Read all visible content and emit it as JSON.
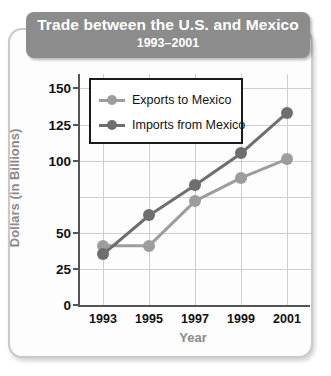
{
  "title": {
    "main": "Trade between the U.S. and Mexico",
    "sub": "1993–2001"
  },
  "colors": {
    "exports": "#9d9d9d",
    "imports": "#6e6e6e",
    "banner": "#8c8c8c",
    "axis": "#555555",
    "grid": "#cfcfcf",
    "axis_title": "#8a8a8a"
  },
  "chart_data": {
    "type": "line",
    "title": "Trade between the U.S. and Mexico",
    "subtitle": "1993–2001",
    "xlabel": "Year",
    "ylabel": "Dollars (in Billions)",
    "categories": [
      "1993",
      "1995",
      "1997",
      "1999",
      "2001"
    ],
    "x": [
      1993,
      1995,
      1997,
      1999,
      2001
    ],
    "xlim": [
      1992,
      2002
    ],
    "ylim": [
      0,
      160
    ],
    "ytick_labels": [
      "0",
      "25",
      "50",
      "100",
      "125",
      "150"
    ],
    "ytick_values": [
      0,
      25,
      50,
      100,
      125,
      150
    ],
    "grid": true,
    "legend_position": "upper-left-inside",
    "series": [
      {
        "name": "Exports to Mexico",
        "color": "#9d9d9d",
        "values": [
          41,
          41,
          72,
          88,
          101
        ]
      },
      {
        "name": "Imports from Mexico",
        "color": "#6e6e6e",
        "values": [
          35,
          62,
          83,
          105,
          133
        ]
      }
    ]
  }
}
